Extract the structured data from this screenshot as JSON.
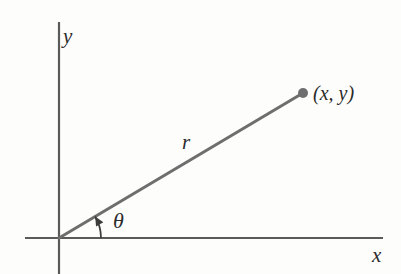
{
  "figure": {
    "background_color": "#fdfdfc",
    "width": 401,
    "height": 274
  },
  "colors": {
    "axis": "#5a5a5a",
    "ray": "#6e6e6e",
    "point_marker": "#6e6e6e",
    "arc": "#3c3c3c",
    "text": "#2b2b2b"
  },
  "axes": {
    "origin": {
      "x": 59,
      "y": 238
    },
    "x_axis": {
      "label": "x",
      "start_x": 25,
      "end_x": 383,
      "y": 238
    },
    "y_axis": {
      "label": "y",
      "x": 59,
      "start_y": 22,
      "end_y": 274
    }
  },
  "ray": {
    "label": "r",
    "from": {
      "x": 59,
      "y": 238
    },
    "to": {
      "x": 303,
      "y": 93
    },
    "stroke_width": 3
  },
  "point": {
    "label": "(x, y)",
    "x": 303,
    "y": 93,
    "radius": 5
  },
  "angle": {
    "label": "θ",
    "arc_radius": 42,
    "start_degrees": 0,
    "end_degrees": 30.7,
    "has_arrowhead": true
  },
  "chart_data": {
    "type": "scatter",
    "title": "",
    "xlabel": "x",
    "ylabel": "y",
    "annotations": [
      {
        "text": "(x, y)",
        "kind": "point-label"
      },
      {
        "text": "r",
        "kind": "segment-length-label"
      },
      {
        "text": "θ",
        "kind": "angle-label"
      }
    ],
    "series": [
      {
        "name": "point",
        "x": [
          303
        ],
        "y": [
          93
        ]
      }
    ],
    "grid": false,
    "legend": "none"
  }
}
